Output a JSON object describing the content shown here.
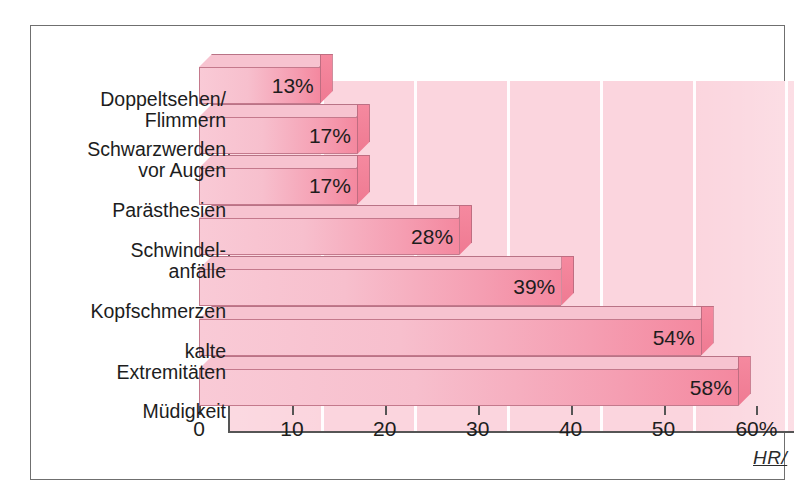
{
  "figure": {
    "signature": "HR/",
    "background_color": "#ffffff",
    "panel_color": "#fbd5de",
    "frame_color": "#6f6f6f",
    "bar_fill_light": "#f9cad6",
    "bar_fill_dark": "#f4889f",
    "bar_cap_color": "#ef7a92",
    "bar_outline_color": "#c4798c",
    "axis_color": "#555555",
    "text_color": "#1d1d1d"
  },
  "chart_data": {
    "type": "bar",
    "orientation": "horizontal",
    "title": "",
    "subtitle": "",
    "xlabel": "",
    "ylabel": "",
    "xlim": [
      0,
      60
    ],
    "grid": true,
    "legend": null,
    "axis_unit": "%",
    "categories": [
      "Doppeltsehen/\nFlimmern",
      "Schwarzwerden\nvor Augen",
      "Parästhesien",
      "Schwindel-\nanfälle",
      "Kopfschmerzen",
      "kalte\nExtremitäten",
      "Müdigkeit"
    ],
    "values": [
      13,
      17,
      17,
      28,
      39,
      54,
      58
    ],
    "data_labels": [
      "13%",
      "17%",
      "17%",
      "28%",
      "39%",
      "54%",
      "58%"
    ],
    "xticks": [
      0,
      10,
      20,
      30,
      40,
      50,
      60
    ],
    "xtick_labels": [
      "0",
      "10",
      "20",
      "30",
      "40",
      "50",
      "60%"
    ]
  }
}
